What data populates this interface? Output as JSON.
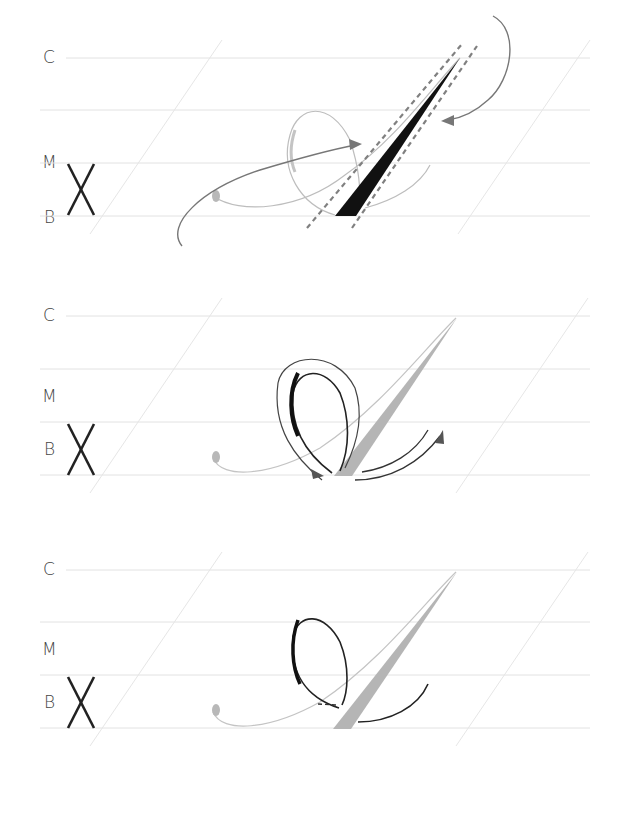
{
  "figure": {
    "guideline_labels": {
      "cap": "C",
      "mid": "M",
      "base": "B"
    },
    "slant_marker": "X",
    "colors": {
      "guideline": "#e2e2e2",
      "slant_line": "#e6e6e6",
      "label": "#444444",
      "ink_black": "#111111",
      "ink_gray": "#b5b5b5",
      "arrow": "#777777",
      "dashed_guide": "#808080"
    },
    "panels": [
      {
        "id": 1,
        "step": "Main diagonal shade stroke with dashed width guides and directional arrows"
      },
      {
        "id": 2,
        "step": "Oval loop stroke with outlined path and direction arrows"
      },
      {
        "id": 3,
        "step": "Completed loop and exit stroke over gray shaded diagonal"
      }
    ]
  }
}
